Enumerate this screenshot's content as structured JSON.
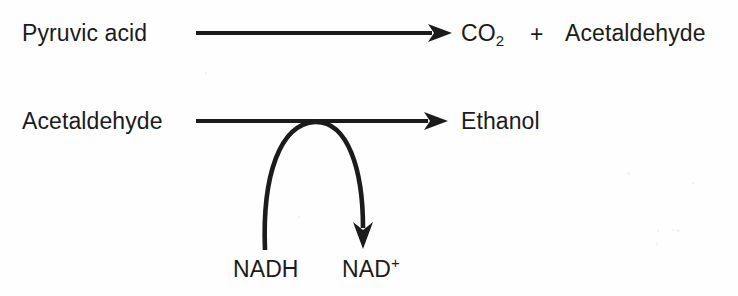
{
  "diagram": {
    "background_color": "#fefefe",
    "ink_color": "#1b1b1b",
    "reactions": [
      {
        "id": "reaction-1",
        "reactant": "Pyruvic acid",
        "operator": "+",
        "products": [
          "CO",
          "Acetaldehyde"
        ],
        "product_subscript": "2",
        "arrow": {
          "type": "straight-arrow-right",
          "x_start": 196,
          "x_end": 450,
          "y": 33
        }
      },
      {
        "id": "reaction-2",
        "reactant": "Acetaldehyde",
        "product": "Ethanol",
        "arrow": {
          "type": "straight-arrow-right",
          "x_start": 196,
          "x_end": 446,
          "y": 121
        },
        "coupled_arrow": {
          "type": "curved-arrow-down",
          "cofactor_in": "NADH",
          "cofactor_out": "NAD",
          "cofactor_out_superscript": "+",
          "x_start": 265,
          "y_start": 250,
          "apex_x": 315,
          "apex_y": 122,
          "x_end": 363,
          "y_end": 245
        }
      }
    ],
    "labels": {
      "reactant_1": "Pyruvic acid",
      "product_1_formula": "CO",
      "product_1_subscript": "2",
      "plus": "+",
      "product_1_second": "Acetaldehyde",
      "reactant_2": "Acetaldehyde",
      "product_2": "Ethanol",
      "cofactor_in": "NADH",
      "cofactor_out": "NAD",
      "cofactor_out_superscript": "+"
    }
  }
}
